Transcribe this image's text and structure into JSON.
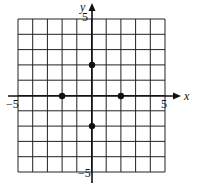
{
  "chart_data": {
    "type": "scatter",
    "title": "",
    "xlabel": "x",
    "ylabel": "y",
    "xlim": [
      -5,
      5
    ],
    "ylim": [
      -5,
      5
    ],
    "grid": true,
    "grid_step": 1,
    "tick_labels": {
      "x_min": "−5",
      "x_max": "5",
      "y_max": "5",
      "y_min": "−5"
    },
    "points": [
      {
        "x": 0,
        "y": 2
      },
      {
        "x": -2,
        "y": 0
      },
      {
        "x": 2,
        "y": 0
      },
      {
        "x": 0,
        "y": -2
      }
    ]
  },
  "colors": {
    "grid": "#222222",
    "axis": "#111111",
    "point": "#111111",
    "background": "#ffffff"
  }
}
